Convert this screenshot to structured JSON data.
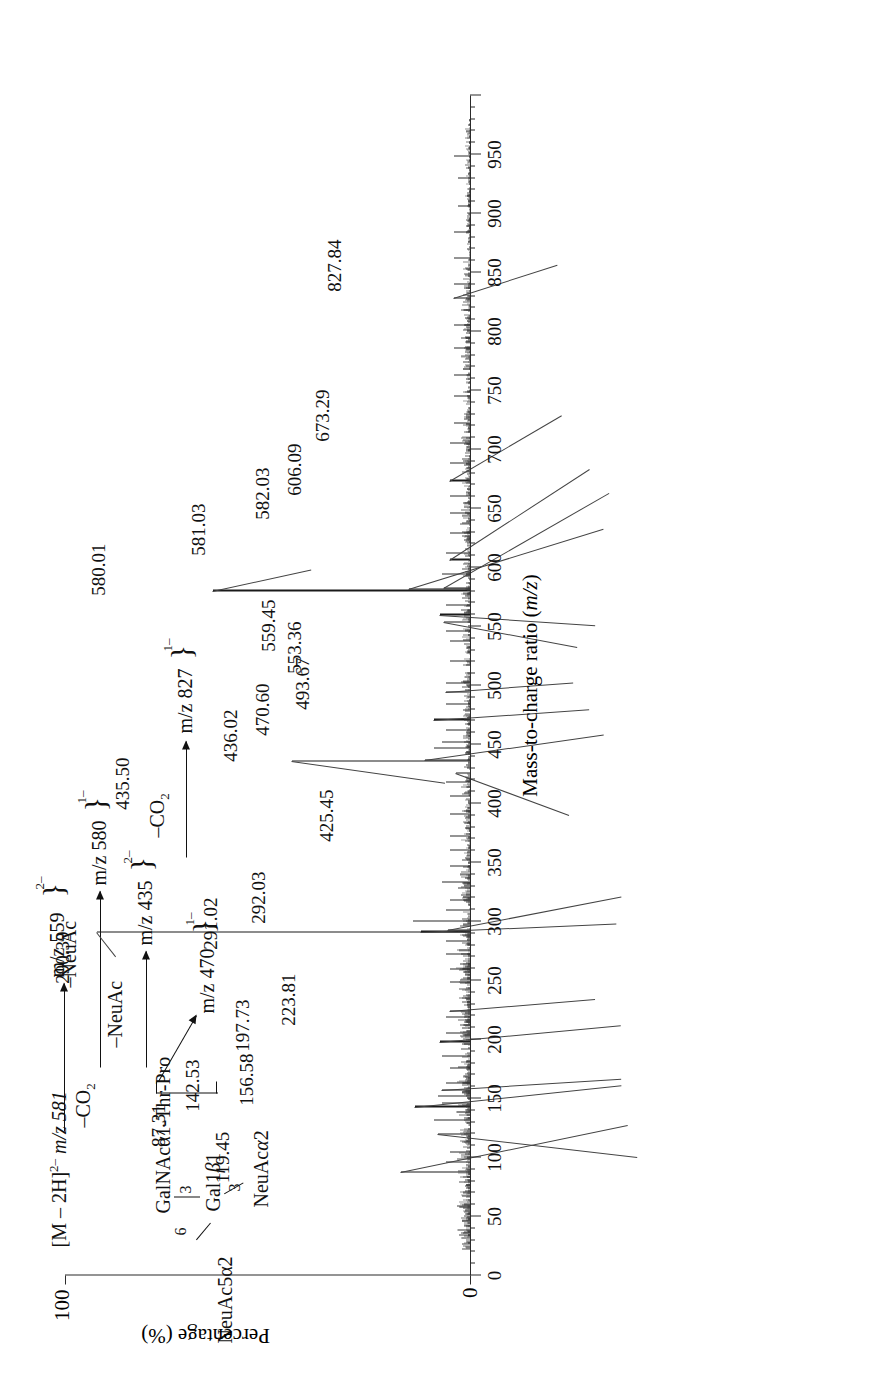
{
  "figure": {
    "kind": "mass-spectrum",
    "orientation_note": "page rotated 90 degrees"
  },
  "axes": {
    "x_title": "Mass-to-charge ratio (m/z)",
    "y_title": "Percentage (%)",
    "x_ticks": [
      0,
      50,
      100,
      150,
      200,
      250,
      300,
      350,
      400,
      450,
      500,
      550,
      600,
      650,
      700,
      750,
      800,
      850,
      900,
      950
    ],
    "x_tick_labels": [
      "0",
      "50",
      "100",
      "150",
      "200",
      "250",
      "300",
      "350",
      "400",
      "450",
      "500",
      "550",
      "600",
      "650",
      "700",
      "750",
      "800",
      "850",
      "900",
      "950"
    ],
    "x_min": 0,
    "x_max": 1000,
    "y_min": 0,
    "y_max": 100,
    "y_tick_labels": [
      "0",
      "100"
    ]
  },
  "chart_data": {
    "type": "line",
    "title": "",
    "xlabel": "Mass-to-charge ratio (m/z)",
    "ylabel": "Percentage (%)",
    "xlim": [
      0,
      1000
    ],
    "ylim": [
      0,
      100
    ],
    "grid": false,
    "legend": "none",
    "x": [
      87.31,
      119.45,
      142.53,
      156.58,
      197.73,
      223.81,
      290.39,
      291.02,
      292.03,
      425.45,
      435.5,
      436.02,
      470.6,
      493.67,
      553.36,
      559.45,
      580.01,
      581.03,
      582.03,
      606.09,
      673.29,
      827.84
    ],
    "values": [
      17.0,
      8.0,
      13.5,
      7.0,
      7.5,
      5.0,
      92.0,
      12.0,
      5.5,
      3.5,
      44.0,
      11.0,
      9.0,
      6.0,
      6.5,
      7.5,
      63.5,
      15.0,
      6.5,
      5.0,
      5.0,
      4.0
    ],
    "peaks": [
      {
        "mz": 87.31,
        "label": "87.31",
        "intensity": 17.0
      },
      {
        "mz": 119.45,
        "label": "119.45",
        "intensity": 8.0
      },
      {
        "mz": 142.53,
        "label": "142.53",
        "intensity": 13.5
      },
      {
        "mz": 156.58,
        "label": "156.58",
        "intensity": 7.0
      },
      {
        "mz": 197.73,
        "label": "197.73",
        "intensity": 7.5
      },
      {
        "mz": 223.81,
        "label": "223.81",
        "intensity": 5.0
      },
      {
        "mz": 290.39,
        "label": "290.39",
        "intensity": 92.0
      },
      {
        "mz": 291.02,
        "label": "291.02",
        "intensity": 12.0
      },
      {
        "mz": 292.03,
        "label": "292.03",
        "intensity": 5.5
      },
      {
        "mz": 425.45,
        "label": "425.45",
        "intensity": 3.5
      },
      {
        "mz": 435.5,
        "label": "435.50",
        "intensity": 44.0
      },
      {
        "mz": 436.02,
        "label": "436.02",
        "intensity": 11.0
      },
      {
        "mz": 470.6,
        "label": "470.60",
        "intensity": 9.0
      },
      {
        "mz": 493.67,
        "label": "493.67",
        "intensity": 6.0
      },
      {
        "mz": 553.36,
        "label": "553.36",
        "intensity": 6.5
      },
      {
        "mz": 559.45,
        "label": "559.45",
        "intensity": 7.5
      },
      {
        "mz": 580.01,
        "label": "580.01",
        "intensity": 63.5
      },
      {
        "mz": 581.03,
        "label": "581.03",
        "intensity": 15.0
      },
      {
        "mz": 582.03,
        "label": "582.03",
        "intensity": 6.5
      },
      {
        "mz": 606.09,
        "label": "606.09",
        "intensity": 5.0
      },
      {
        "mz": 673.29,
        "label": "673.29",
        "intensity": 5.0
      },
      {
        "mz": 827.84,
        "label": "827.84",
        "intensity": 4.0
      }
    ]
  },
  "scheme": {
    "precursor": "[M – 2H]2– m/z 581",
    "precursor_text": "[M – 2H]",
    "precursor_charge": "2–",
    "precursor_mz": "m/z 581",
    "structure": {
      "residue_top": "NeuAc5α2",
      "link_top": "6",
      "core": "GalNAcα1-Thr-Pro",
      "link_branch": "3",
      "residue_mid": "Gal1β1",
      "link_mid": "3",
      "residue_bottom": "NeuAcα2"
    },
    "losses": {
      "co2": "–CO2",
      "neuac": "–NeuAc"
    },
    "products": [
      {
        "loss": "–CO2",
        "mz": "m/z 559",
        "charge": "2–"
      },
      {
        "loss": "–NeuAc",
        "mz": "m/z 580",
        "charge": "1–"
      },
      {
        "loss": "–NeuAc",
        "mz": "m/z 435",
        "charge": "2–"
      },
      {
        "loss": "–CO2",
        "mz": "m/z 827",
        "charge": "1–"
      },
      {
        "loss": "",
        "mz": "m/z 470",
        "charge": "1–"
      }
    ]
  },
  "colors": {
    "ink": "#1a1a1a",
    "axis": "#2b2b2b",
    "leader": "#444444",
    "background": "#ffffff"
  }
}
